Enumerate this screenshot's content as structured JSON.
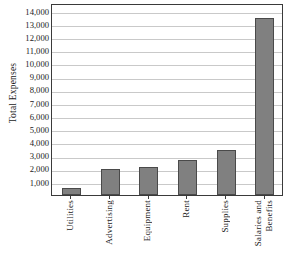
{
  "chart_data": {
    "type": "bar",
    "title": "",
    "subtitle": "",
    "xlabel": "",
    "ylabel": "Total Expenses",
    "categories": [
      "Utilities",
      "Advertising",
      "Equipment",
      "Rent",
      "Supplies",
      "Salaries and Benefits"
    ],
    "category_lines": [
      [
        "Utilities"
      ],
      [
        "Advertising"
      ],
      [
        "Equipment"
      ],
      [
        "Rent"
      ],
      [
        "Supplies"
      ],
      [
        "Salaries and",
        "Benefits"
      ]
    ],
    "values": [
      500,
      1950,
      2150,
      2650,
      3400,
      13450
    ],
    "ylim": [
      0,
      14600
    ],
    "ytick_values": [
      1000,
      2000,
      3000,
      4000,
      5000,
      6000,
      7000,
      8000,
      9000,
      10000,
      11000,
      12000,
      13000,
      14000
    ],
    "ytick_labels": [
      "1,000",
      "2,000",
      "3,000",
      "4,000",
      "5,000",
      "6,000",
      "7,000",
      "8,000",
      "9,000",
      "10,000",
      "11,000",
      "12,000",
      "13,000",
      "14,000"
    ],
    "grid": true,
    "grid_axis": "y",
    "legend": false,
    "legend_position": "none",
    "bar_color": "#808080",
    "bar_edge_color": "#4a4a4a",
    "grid_color": "#c9c9c9",
    "frame_color": "#3a3a3a",
    "background_color": "#ffffff",
    "text_color": "#1a1a1a"
  }
}
